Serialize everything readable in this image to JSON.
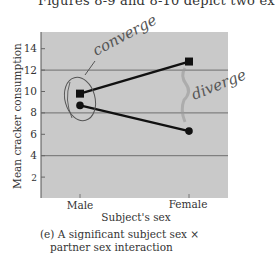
{
  "top_text": "Figures 8-9 and 8-10 depict two ex",
  "annotations": {
    "converge": "converge",
    "diverge": "diverge"
  },
  "caption": {
    "line1": "(e) A significant subject sex ×",
    "line2": "partner sex interaction"
  },
  "colors": {
    "plot_background": "#c9c9c9",
    "gridline": "#6e6e6e",
    "series": "#111111",
    "handwriting": "#555555"
  },
  "chart_data": {
    "type": "line",
    "title": "",
    "xlabel": "Subject's sex",
    "ylabel": "Mean cracker consumption",
    "categories": [
      "Male",
      "Female"
    ],
    "yticks": [
      2,
      4,
      6,
      8,
      10,
      12,
      14
    ],
    "ylim": [
      0,
      15.5
    ],
    "grid": {
      "on": true,
      "y_lines": [
        4,
        8,
        12
      ]
    },
    "legend": null,
    "series": [
      {
        "name": "square-marker series",
        "marker": "square",
        "values": [
          9.8,
          12.8
        ]
      },
      {
        "name": "circle-marker series",
        "marker": "circle",
        "values": [
          8.7,
          6.3
        ]
      }
    ],
    "handwritten_annotations": [
      {
        "text": "converge",
        "points_to": "Male"
      },
      {
        "text": "diverge",
        "points_to": "Female"
      }
    ]
  }
}
